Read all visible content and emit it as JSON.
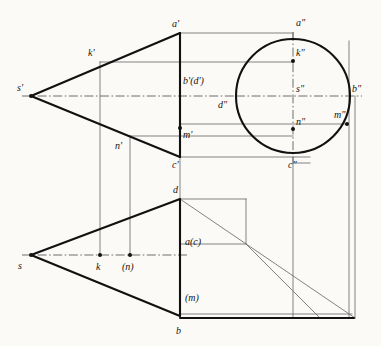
{
  "figure": {
    "type": "engineering-drawing",
    "canvas": {
      "width": 381,
      "height": 346
    },
    "colors": {
      "background": "#fbfaf7",
      "outline_heavy": "#111111",
      "projection_light": "#6f6f6f",
      "axis_dashdot": "#4a4a4a",
      "text": "#16140f"
    }
  },
  "views": {
    "front": {
      "name": "front-view",
      "label": "V (front elevation)"
    },
    "side": {
      "name": "side-view",
      "label": "W (left side elevation)"
    },
    "top": {
      "name": "top-view",
      "label": "H (plan)"
    }
  },
  "circle": {
    "name": "side-view-base-circle",
    "cx": 293,
    "cy": 96,
    "r": 57
  },
  "points": {
    "front": [
      {
        "id": "s-prime",
        "label": "s'",
        "x": 31,
        "y": 96,
        "lx": 17,
        "ly": 83,
        "dot": true
      },
      {
        "id": "k-prime",
        "label": "k'",
        "x": 100,
        "y": 62,
        "lx": 88,
        "ly": 48,
        "dot": false
      },
      {
        "id": "a-prime",
        "label": "a'",
        "x": 180,
        "y": 33,
        "lx": 172,
        "ly": 19,
        "dot": false
      },
      {
        "id": "bd-prime",
        "label": "b'(d')",
        "x": 180,
        "y": 96,
        "lx": 183,
        "ly": 76,
        "dot": false
      },
      {
        "id": "m-prime",
        "label": "m'",
        "x": 180,
        "y": 128,
        "lx": 183,
        "ly": 130,
        "dot": true
      },
      {
        "id": "n-prime",
        "label": "n'",
        "x": 130,
        "y": 136,
        "lx": 115,
        "ly": 141,
        "dot": false
      },
      {
        "id": "c-prime",
        "label": "c'",
        "x": 180,
        "y": 157,
        "lx": 172,
        "ly": 160,
        "dot": false
      }
    ],
    "side": [
      {
        "id": "a-dprime",
        "label": "a\"",
        "x": 293,
        "y": 39,
        "lx": 296,
        "ly": 18,
        "dot": false
      },
      {
        "id": "k-dprime",
        "label": "k\"",
        "x": 293,
        "y": 61,
        "lx": 296,
        "ly": 48,
        "dot": true
      },
      {
        "id": "s-dprime",
        "label": "s\"",
        "x": 293,
        "y": 96,
        "lx": 296,
        "ly": 84,
        "dot": false
      },
      {
        "id": "b-dprime",
        "label": "b\"",
        "x": 350,
        "y": 96,
        "lx": 352,
        "ly": 84,
        "dot": false
      },
      {
        "id": "d-dprime",
        "label": "d\"",
        "x": 236,
        "y": 96,
        "lx": 218,
        "ly": 100,
        "dot": false
      },
      {
        "id": "m-dprime",
        "label": "m\"",
        "x": 347,
        "y": 124,
        "lx": 334,
        "ly": 110,
        "dot": true
      },
      {
        "id": "n-dprime",
        "label": "n\"",
        "x": 293,
        "y": 129,
        "lx": 296,
        "ly": 117,
        "dot": true
      },
      {
        "id": "c-dprime",
        "label": "c\"",
        "x": 293,
        "y": 153,
        "lx": 288,
        "ly": 160,
        "dot": false
      }
    ],
    "top": [
      {
        "id": "s-top",
        "label": "s",
        "x": 31,
        "y": 255,
        "lx": 18,
        "ly": 261,
        "dot": true
      },
      {
        "id": "k-top",
        "label": "k",
        "x": 100,
        "y": 255,
        "lx": 96,
        "ly": 262,
        "dot": true
      },
      {
        "id": "n-top",
        "label": "(n)",
        "x": 130,
        "y": 255,
        "lx": 122,
        "ly": 262,
        "dot": true
      },
      {
        "id": "d-top",
        "label": "d",
        "x": 180,
        "y": 199,
        "lx": 173,
        "ly": 185,
        "dot": false
      },
      {
        "id": "ac-top",
        "label": "a(c)",
        "x": 180,
        "y": 244,
        "lx": 185,
        "ly": 237,
        "dot": false
      },
      {
        "id": "m-top",
        "label": "(m)",
        "x": 180,
        "y": 296,
        "lx": 185,
        "ly": 293,
        "dot": false
      },
      {
        "id": "b-top",
        "label": "b",
        "x": 180,
        "y": 316,
        "lx": 176,
        "ly": 326,
        "dot": false
      }
    ]
  },
  "geometry": {
    "heavy_paths": [
      {
        "name": "front-cone-upper-edge",
        "d": "M 31 96 L 180 33"
      },
      {
        "name": "front-cone-lower-edge",
        "d": "M 31 96 L 180 157"
      },
      {
        "name": "front-cone-base-line",
        "d": "M 180 33 L 180 157"
      },
      {
        "name": "top-cone-upper-edge",
        "d": "M 31 255 L 180 199"
      },
      {
        "name": "top-cone-lower-edge",
        "d": "M 31 255 L 180 316"
      },
      {
        "name": "top-cone-base-line",
        "d": "M 180 199 L 180 316"
      },
      {
        "name": "top-base-bottom-rail",
        "d": "M 180 318 L 354 318"
      }
    ],
    "light_paths": [
      {
        "name": "apex-to-a-dprime-top-rail",
        "d": "M 180 33 L 293 33"
      },
      {
        "name": "a-dprime-vertical-tick",
        "d": "M 293 33 L 293 40"
      },
      {
        "name": "k-prime-to-k-dprime-rail",
        "d": "M 100 62 L 293 62"
      },
      {
        "name": "m-prime-to-m-dprime-rail",
        "d": "M 180 124 L 347 124"
      },
      {
        "name": "n-prime-to-n-dprime-rail",
        "d": "M 130 136 L 293 136"
      },
      {
        "name": "c-prime-to-c-dprime-rail",
        "d": "M 180 157 L 310 157"
      },
      {
        "name": "b-dprime-right-vertical",
        "d": "M 349 41 L 349 318"
      },
      {
        "name": "outer-right-vertical",
        "d": "M 355 96 L 355 318"
      },
      {
        "name": "k-projection-vertical",
        "d": "M 100 62 L 100 255"
      },
      {
        "name": "n-projection-vertical",
        "d": "M 130 136 L 130 255"
      },
      {
        "name": "front-base-to-top-vertical",
        "d": "M 180 157 L 180 199"
      },
      {
        "name": "c-dprime-vertical-down",
        "d": "M 293 157 L 293 318"
      },
      {
        "name": "top-view-d-rail",
        "d": "M 180 199 L 246 199"
      },
      {
        "name": "top-view-d-rail-down",
        "d": "M 246 199 L 246 244"
      },
      {
        "name": "top-view-ac-rail",
        "d": "M 180 244 L 246 244"
      },
      {
        "name": "miter-45-line",
        "d": "M 246 244 L 320 318"
      },
      {
        "name": "top-right-corner-diagonal",
        "d": "M 180 199 L 355 318"
      },
      {
        "name": "top-base-inner-rail",
        "d": "M 180 314 L 352 314"
      },
      {
        "name": "side-bottom-rail",
        "d": "M 293 163 L 310 163"
      }
    ],
    "dashdot_paths": [
      {
        "name": "front-view-axis",
        "d": "M 22 96 L 236 96"
      },
      {
        "name": "side-view-axis",
        "d": "M 236 96 L 362 96"
      },
      {
        "name": "side-view-vertical-axis",
        "d": "M 293 32 L 293 162"
      },
      {
        "name": "top-view-axis",
        "d": "M 22 255 L 188 255"
      }
    ]
  },
  "labels_legend": {
    "apex_front": "s'",
    "apex_top": "s",
    "apex_side": "s\"",
    "base_points": [
      "a",
      "b",
      "c",
      "d"
    ],
    "surface_points": [
      "k",
      "m",
      "n"
    ]
  }
}
